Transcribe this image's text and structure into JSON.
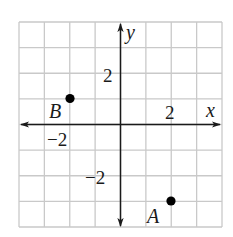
{
  "chart_data": {
    "type": "scatter",
    "title": "",
    "xlabel": "x",
    "ylabel": "y",
    "xlim": [
      -4,
      4
    ],
    "ylim": [
      -4,
      4
    ],
    "grid": true,
    "grid_step": 1,
    "x_tick_labels": [
      {
        "value": -2,
        "label": "−2"
      },
      {
        "value": 2,
        "label": "2"
      }
    ],
    "y_tick_labels": [
      {
        "value": 2,
        "label": "2"
      },
      {
        "value": -2,
        "label": "−2"
      }
    ],
    "points": [
      {
        "label": "A",
        "x": 2,
        "y": -3
      },
      {
        "label": "B",
        "x": -2,
        "y": 1
      }
    ],
    "colors": {
      "grid": "#c9c9c9",
      "axis": "#1a1a1a",
      "point": "#000000"
    }
  },
  "axes": {
    "x_label": "x",
    "y_label": "y"
  },
  "ticks": {
    "x_neg2": "−2",
    "x_pos2": "2",
    "y_pos2": "2",
    "y_neg2": "−2"
  },
  "points": {
    "A": "A",
    "B": "B"
  }
}
